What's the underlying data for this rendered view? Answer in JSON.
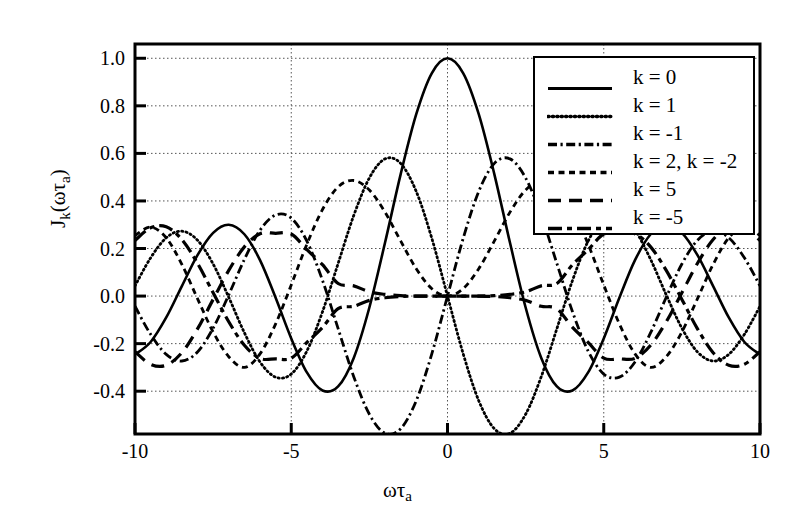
{
  "chart_data": {
    "type": "line",
    "title": "",
    "xlabel": "ωτa",
    "ylabel": "Jk(ωτa)",
    "xlim": [
      -10,
      10
    ],
    "ylim": [
      -0.58,
      1.06
    ],
    "xticks": [
      -10,
      -5,
      0,
      5,
      10
    ],
    "xticklabels": [
      "-10",
      "-5",
      "0",
      "5",
      "10"
    ],
    "yticks": [
      1.0,
      0.8,
      0.6,
      0.4,
      0.2,
      0.0,
      -0.2,
      -0.4
    ],
    "yticklabels": [
      "1.0",
      "0.8",
      "0.6",
      "0.4",
      "0.2",
      "0.0",
      "-0.2",
      "-0.4"
    ],
    "grid": true,
    "grid_style": "dotted",
    "legend_position": "top-right",
    "line_color": "#000000",
    "series": [
      {
        "name": "k = 0",
        "order": 0,
        "style": "solid",
        "x": [
          -10,
          -9.5,
          -9,
          -8.5,
          -8,
          -7.5,
          -7,
          -6.5,
          -6,
          -5.5,
          -5,
          -4.5,
          -4,
          -3.5,
          -3,
          -2.5,
          -2,
          -1.5,
          -1,
          -0.5,
          0,
          0.5,
          1,
          1.5,
          2,
          2.5,
          3,
          3.5,
          4,
          4.5,
          5,
          5.5,
          6,
          6.5,
          7,
          7.5,
          8,
          8.5,
          9,
          9.5,
          10
        ],
        "y": [
          -0.246,
          -0.193,
          -0.09,
          0.042,
          0.172,
          0.266,
          0.3,
          0.26,
          0.151,
          -0.007,
          -0.178,
          -0.321,
          -0.397,
          -0.38,
          -0.26,
          -0.048,
          0.224,
          0.512,
          0.765,
          0.938,
          1.0,
          0.938,
          0.765,
          0.512,
          0.224,
          -0.048,
          -0.26,
          -0.38,
          -0.397,
          -0.321,
          -0.178,
          -0.007,
          0.151,
          0.26,
          0.3,
          0.266,
          0.172,
          0.042,
          -0.09,
          -0.193,
          -0.246
        ]
      },
      {
        "name": "k = 1",
        "order": 1,
        "style": "dotted",
        "x": [
          -10,
          -9.5,
          -9,
          -8.5,
          -8,
          -7.5,
          -7,
          -6.5,
          -6,
          -5.5,
          -5,
          -4.5,
          -4,
          -3.5,
          -3,
          -2.5,
          -2,
          -1.5,
          -1,
          -0.5,
          0,
          0.5,
          1,
          1.5,
          2,
          2.5,
          3,
          3.5,
          4,
          4.5,
          5,
          5.5,
          6,
          6.5,
          7,
          7.5,
          8,
          8.5,
          9,
          9.5,
          10
        ],
        "y": [
          0.043,
          0.161,
          0.245,
          0.273,
          0.235,
          0.135,
          -0.005,
          -0.154,
          -0.277,
          -0.341,
          -0.328,
          -0.231,
          -0.066,
          0.137,
          0.339,
          0.497,
          0.577,
          0.558,
          0.44,
          0.242,
          0.0,
          -0.242,
          -0.44,
          -0.558,
          -0.577,
          -0.497,
          -0.339,
          -0.137,
          0.066,
          0.231,
          0.328,
          0.341,
          0.277,
          0.154,
          0.005,
          -0.135,
          -0.235,
          -0.273,
          -0.245,
          -0.161,
          -0.043
        ]
      },
      {
        "name": "k = -1",
        "order": -1,
        "style": "dashdot",
        "x": [
          -10,
          -9.5,
          -9,
          -8.5,
          -8,
          -7.5,
          -7,
          -6.5,
          -6,
          -5.5,
          -5,
          -4.5,
          -4,
          -3.5,
          -3,
          -2.5,
          -2,
          -1.5,
          -1,
          -0.5,
          0,
          0.5,
          1,
          1.5,
          2,
          2.5,
          3,
          3.5,
          4,
          4.5,
          5,
          5.5,
          6,
          6.5,
          7,
          7.5,
          8,
          8.5,
          9,
          9.5,
          10
        ],
        "y": [
          -0.043,
          -0.161,
          -0.245,
          -0.273,
          -0.235,
          -0.135,
          0.005,
          0.154,
          0.277,
          0.341,
          0.328,
          0.231,
          0.066,
          -0.137,
          -0.339,
          -0.497,
          -0.577,
          -0.558,
          -0.44,
          -0.242,
          0.0,
          0.242,
          0.44,
          0.558,
          0.577,
          0.497,
          0.339,
          0.137,
          -0.066,
          -0.231,
          -0.328,
          -0.341,
          -0.277,
          -0.154,
          -0.005,
          0.135,
          0.235,
          0.273,
          0.245,
          0.161,
          0.043
        ]
      },
      {
        "name": "k = 2, k = -2",
        "order": 2,
        "style": "shortdash",
        "x": [
          -10,
          -9.5,
          -9,
          -8.5,
          -8,
          -7.5,
          -7,
          -6.5,
          -6,
          -5.5,
          -5,
          -4.5,
          -4,
          -3.5,
          -3,
          -2.5,
          -2,
          -1.5,
          -1,
          -0.5,
          0,
          0.5,
          1,
          1.5,
          2,
          2.5,
          3,
          3.5,
          4,
          4.5,
          5,
          5.5,
          6,
          6.5,
          7,
          7.5,
          8,
          8.5,
          9,
          9.5,
          10
        ],
        "y": [
          0.255,
          0.29,
          0.245,
          0.133,
          -0.011,
          -0.151,
          -0.255,
          -0.3,
          -0.243,
          -0.117,
          0.047,
          0.218,
          0.364,
          0.459,
          0.486,
          0.446,
          0.353,
          0.232,
          0.115,
          0.031,
          0.0,
          0.031,
          0.115,
          0.232,
          0.353,
          0.446,
          0.486,
          0.459,
          0.364,
          0.218,
          0.047,
          -0.117,
          -0.243,
          -0.3,
          -0.255,
          -0.151,
          -0.011,
          0.133,
          0.245,
          0.29,
          0.255
        ]
      },
      {
        "name": "k = 5",
        "order": 5,
        "style": "longdash",
        "x": [
          -10,
          -9.5,
          -9,
          -8.5,
          -8,
          -7.5,
          -7,
          -6.5,
          -6,
          -5.5,
          -5,
          -4.5,
          -4,
          -3.5,
          -3,
          -2.5,
          -2,
          -1.5,
          -1,
          -0.5,
          0,
          0.5,
          1,
          1.5,
          2,
          2.5,
          3,
          3.5,
          4,
          4.5,
          5,
          5.5,
          6,
          6.5,
          7,
          7.5,
          8,
          8.5,
          9,
          9.5,
          10
        ],
        "y": [
          -0.234,
          -0.287,
          -0.291,
          -0.238,
          -0.138,
          -0.014,
          0.108,
          0.207,
          0.262,
          0.264,
          0.261,
          0.195,
          0.132,
          0.053,
          0.043,
          0.018,
          0.007,
          0.002,
          0.0,
          0.0,
          0.0,
          0.0,
          0.0,
          -0.002,
          -0.007,
          -0.018,
          -0.043,
          -0.053,
          -0.132,
          -0.195,
          -0.261,
          -0.264,
          -0.262,
          -0.207,
          -0.108,
          0.014,
          0.138,
          0.238,
          0.291,
          0.287,
          0.234
        ]
      },
      {
        "name": "k = -5",
        "order": -5,
        "style": "dashdashdot",
        "x": [
          -10,
          -9.5,
          -9,
          -8.5,
          -8,
          -7.5,
          -7,
          -6.5,
          -6,
          -5.5,
          -5,
          -4.5,
          -4,
          -3.5,
          -3,
          -2.5,
          -2,
          -1.5,
          -1,
          -0.5,
          0,
          0.5,
          1,
          1.5,
          2,
          2.5,
          3,
          3.5,
          4,
          4.5,
          5,
          5.5,
          6,
          6.5,
          7,
          7.5,
          8,
          8.5,
          9,
          9.5,
          10
        ],
        "y": [
          0.234,
          0.287,
          0.291,
          0.238,
          0.138,
          0.014,
          -0.108,
          -0.207,
          -0.262,
          -0.264,
          -0.261,
          -0.195,
          -0.132,
          -0.053,
          -0.043,
          -0.018,
          -0.007,
          -0.002,
          0.0,
          0.0,
          0.0,
          0.0,
          0.0,
          0.002,
          0.007,
          0.018,
          0.043,
          0.053,
          0.132,
          0.195,
          0.261,
          0.264,
          0.262,
          0.207,
          0.108,
          -0.014,
          -0.138,
          -0.238,
          -0.291,
          -0.287,
          -0.234
        ]
      }
    ]
  },
  "axes": {
    "ylabel_parts": {
      "main": "J",
      "sub1": "k",
      "paren_open": "(",
      "omega": "ωτ",
      "sub2": "a",
      "paren_close": ")"
    },
    "xlabel_parts": {
      "omega_tau": "ωτ",
      "sub": "a"
    }
  },
  "legend": {
    "items": [
      {
        "label": "k = 0",
        "style": "solid"
      },
      {
        "label": "k = 1",
        "style": "dotted"
      },
      {
        "label": "k = -1",
        "style": "dashdot"
      },
      {
        "label": "k = 2, k = -2",
        "style": "shortdash"
      },
      {
        "label": "k = 5",
        "style": "longdash"
      },
      {
        "label": "k = -5",
        "style": "dashdashdot"
      }
    ]
  }
}
